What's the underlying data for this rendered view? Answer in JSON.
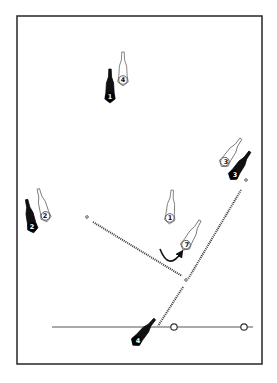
{
  "diagram": {
    "type": "play-diagram",
    "frame": {
      "x": 17,
      "y": 16,
      "width": 245,
      "height": 348,
      "stroke": "#333333"
    },
    "colors": {
      "attacker_fill": "#ffffff",
      "attacker_stroke": "#555555",
      "defender_fill": "#111111",
      "line": "#333333"
    },
    "players": [
      {
        "id": "attacker-4-top",
        "team": "white",
        "number": "4",
        "x": 123,
        "y": 78,
        "angle": 0
      },
      {
        "id": "defender-1",
        "team": "black",
        "number": "1",
        "x": 110,
        "y": 95,
        "angle": 0
      },
      {
        "id": "attacker-3",
        "team": "white",
        "number": "3",
        "x": 226,
        "y": 160,
        "angle": 35
      },
      {
        "id": "defender-3",
        "team": "black",
        "number": "3",
        "x": 235,
        "y": 173,
        "angle": 35
      },
      {
        "id": "attacker-2",
        "team": "white",
        "number": "2",
        "x": 45,
        "y": 214,
        "angle": -15
      },
      {
        "id": "defender-2",
        "team": "black",
        "number": "2",
        "x": 32,
        "y": 225,
        "angle": -12
      },
      {
        "id": "attacker-1-mid",
        "team": "white",
        "number": "1",
        "x": 170,
        "y": 216,
        "angle": 5
      },
      {
        "id": "attacker-7",
        "team": "white",
        "number": "7",
        "x": 187,
        "y": 243,
        "angle": 30
      },
      {
        "id": "defender-4-bottom",
        "team": "black",
        "number": "4",
        "x": 138,
        "y": 339,
        "angle": 40
      }
    ],
    "lines": [
      {
        "id": "pass-line-left",
        "style": "dotted",
        "x1": 93,
        "y1": 222,
        "x2": 182,
        "y2": 276
      },
      {
        "id": "pass-line-right",
        "style": "dotted",
        "x1": 241,
        "y1": 190,
        "x2": 188,
        "y2": 279
      },
      {
        "id": "pass-line-bottom",
        "style": "dotted",
        "x1": 183,
        "y1": 287,
        "x2": 158,
        "y2": 326
      },
      {
        "id": "baseline",
        "style": "solid",
        "x1": 52,
        "y1": 327,
        "x2": 253,
        "y2": 327
      }
    ],
    "markers": [
      {
        "id": "start-dot-left",
        "x": 87,
        "y": 217,
        "r": 1.3
      },
      {
        "id": "junction-dot",
        "x": 186,
        "y": 280,
        "r": 1.3
      },
      {
        "id": "start-dot-right",
        "x": 246,
        "y": 180,
        "r": 1.3
      },
      {
        "id": "baseline-circle-1",
        "x": 174,
        "y": 327,
        "r": 3.2
      },
      {
        "id": "baseline-circle-2",
        "x": 244,
        "y": 327,
        "r": 3.2
      }
    ],
    "movement_arc": {
      "id": "attacker-1-curl",
      "from_x": 160,
      "from y": 249,
      "to_x": 181,
      "to_y": 253
    }
  }
}
